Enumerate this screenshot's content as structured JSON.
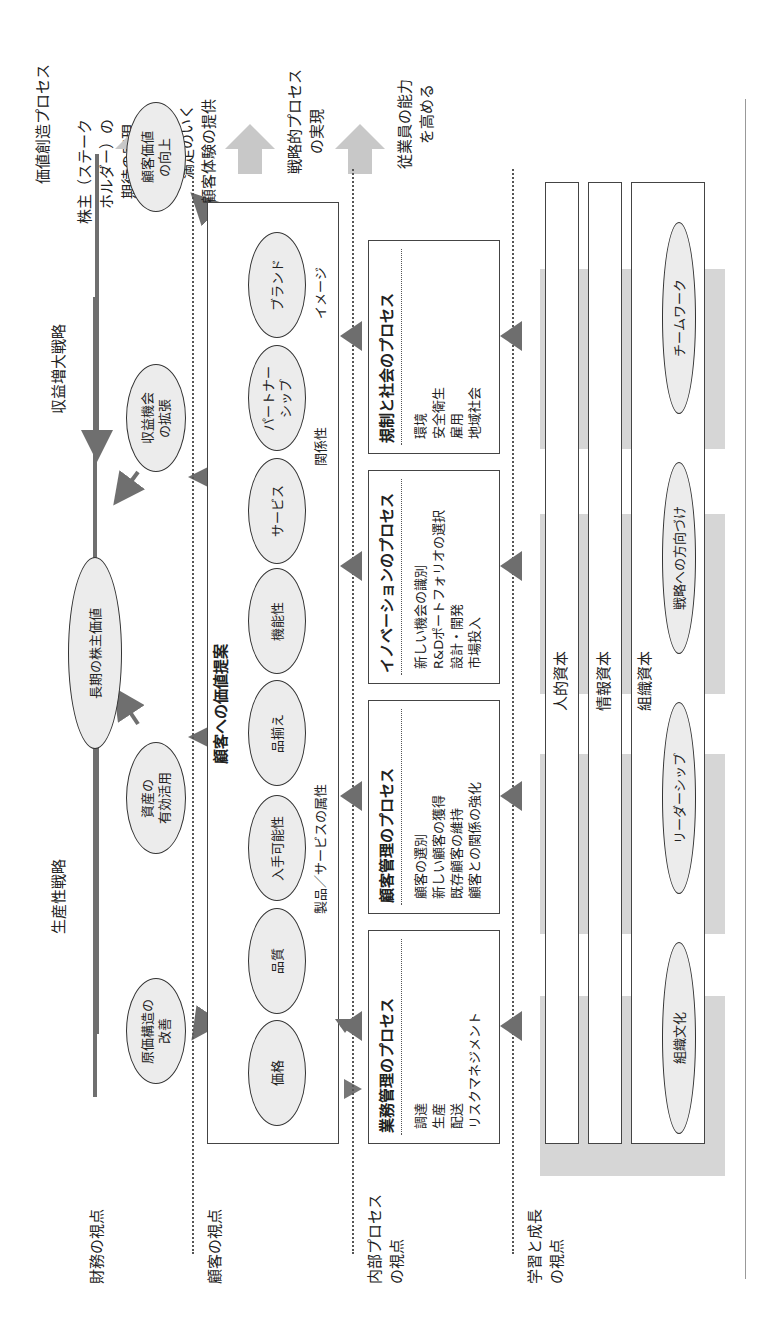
{
  "figure": {
    "orientation": "rotated 90 degrees counter-clockwise (book scan)",
    "header": {
      "process_title": "価値創造プロセス"
    },
    "perspectives": [
      {
        "id": "financial",
        "label": "財務の視点",
        "outcome": "株主（ステークホルダー）の期待の実現"
      },
      {
        "id": "customer",
        "label": "顧客の視点",
        "outcome": "満足のいく顧客体験の提供"
      },
      {
        "id": "internal",
        "label": "内部プロセスの視点",
        "outcome": "戦略的プロセスの実現"
      },
      {
        "id": "learning",
        "label": "学習と成長の視点",
        "outcome": "従業員の能力を高める"
      }
    ],
    "perspective_labels": {
      "financial": "財務の視点",
      "customer": "顧客の視点",
      "internal_1": "内部プロセス",
      "internal_2": "の視点",
      "learning_1": "学習と成長",
      "learning_2": "の視点"
    },
    "outcome_labels": {
      "financial_1": "株主（ステーク",
      "financial_2": "ホルダー）の",
      "financial_3": "期待の実現",
      "customer_1": "満足のいく",
      "customer_2": "顧客体験の提供",
      "internal_1": "戦略的プロセス",
      "internal_2": "の実現",
      "learning_1": "従業員の能力",
      "learning_2": "を高める"
    },
    "financial": {
      "productivity_strategy": "生産性戦略",
      "growth_strategy": "収益増大戦略",
      "nodes": {
        "shareholder_value": "長期の株主価値",
        "cost_structure_1": "原価構造の",
        "cost_structure_2": "改善",
        "asset_util_1": "資産の",
        "asset_util_2": "有効活用",
        "revenue_opp_1": "収益機会",
        "revenue_opp_2": "の拡張",
        "customer_value_1": "顧客価値",
        "customer_value_2": "の向上"
      }
    },
    "customer": {
      "value_proposition_title": "顧客への価値提案",
      "attributes": [
        "価格",
        "品質",
        "入手可能性",
        "品揃え",
        "機能性",
        "サービス",
        "パートナーシップ",
        "ブランド"
      ],
      "partnership_1": "パートナー",
      "partnership_2": "シップ",
      "group_labels": {
        "product_service": "製品／サービスの属性",
        "relationship": "関係性",
        "image": "イメージ"
      }
    },
    "internal": {
      "processes": [
        {
          "title": "業務管理のプロセス",
          "items": [
            "調達",
            "生産",
            "配送",
            "リスクマネジメント"
          ]
        },
        {
          "title": "顧客管理のプロセス",
          "items": [
            "顧客の選別",
            "新しい顧客の獲得",
            "既存顧客の維持",
            "顧客との関係の強化"
          ]
        },
        {
          "title": "イノベーションのプロセス",
          "items": [
            "新しい機会の識別",
            "R&Dポートフォリオの選択",
            "設計・開発",
            "市場投入"
          ]
        },
        {
          "title": "規制と社会のプロセス",
          "items": [
            "環境",
            "安全衛生",
            "雇用",
            "地域社会"
          ]
        }
      ]
    },
    "learning": {
      "capitals": [
        "人的資本",
        "情報資本",
        "組織資本"
      ],
      "organization_elements": [
        "組織文化",
        "リーダーシップ",
        "戦略への方向づけ",
        "チームワーク"
      ]
    },
    "colors": {
      "ellipse_fill": "#ececec",
      "arrow_gray": "#777777",
      "big_arrow_gray": "#c8c8c8",
      "band_gray": "#d6d6d6",
      "line": "#333333"
    }
  }
}
